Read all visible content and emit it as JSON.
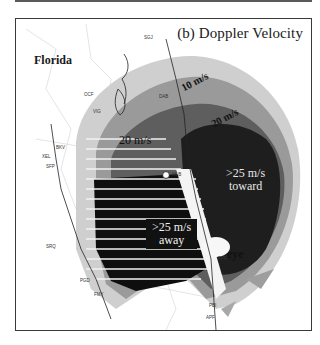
{
  "figure": {
    "panel_title": "(b) Doppler Velocity",
    "region_label": "Florida"
  },
  "annotations": {
    "contour_10": "10 m/s",
    "contour_20_upper": "20 m/s",
    "contour_20_lower": "20 m/s",
    "toward_line1": ">25 m/s",
    "toward_line2": "toward",
    "away_line1": ">25 m/s",
    "away_line2": "away",
    "eye": "eye"
  },
  "stations": {
    "sgj": "SGJ",
    "ocf": "OCF",
    "dab": "DAB",
    "vig": "VIG",
    "bkv": "BKV",
    "xel": "XEL",
    "sfp": "SFP",
    "mlb": "MLB",
    "srq": "SRQ",
    "pgd": "PGD",
    "fmy": "FMY",
    "fpr": "FPR",
    "pbi": "PBI",
    "apf": "APF"
  },
  "colors": {
    "frame": "#3a3a3a",
    "toward_core": "#1e1e1e",
    "away_core": "#0e0e0e",
    "mid_gray": "#6a6a6a",
    "light_gray": "#a8a8a8"
  }
}
